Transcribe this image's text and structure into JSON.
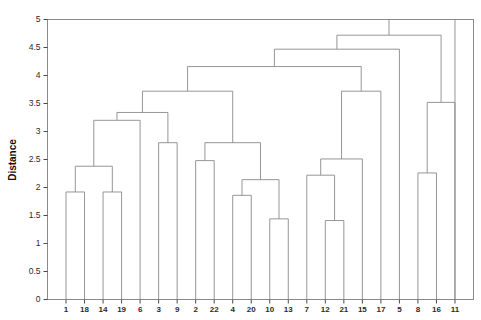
{
  "chart_data": {
    "type": "dendrogram",
    "title": "",
    "xlabel": "",
    "ylabel": "Distance",
    "ylim": [
      0,
      5
    ],
    "yticks": [
      0,
      0.5,
      1,
      1.5,
      2,
      2.5,
      3,
      3.5,
      4,
      4.5,
      5
    ],
    "ytick_labels": [
      "0",
      "0.5",
      "1",
      "1.5",
      "2",
      "2.5",
      "3",
      "3.5",
      "4",
      "4.5",
      "5"
    ],
    "grid": false,
    "legend": null,
    "leaf_order": [
      "1",
      "18",
      "14",
      "19",
      "6",
      "3",
      "9",
      "2",
      "22",
      "4",
      "20",
      "10",
      "13",
      "7",
      "12",
      "21",
      "15",
      "17",
      "5",
      "8",
      "16",
      "11"
    ],
    "leaf_count": 22,
    "line_color": "#8a8a8a",
    "frame_color": "#8a8a8a",
    "text_color": "#2b2b2b",
    "links": [
      {
        "id": "m1",
        "left": "1",
        "right": "18",
        "height": 1.92
      },
      {
        "id": "m2",
        "left": "14",
        "right": "19",
        "height": 1.92
      },
      {
        "id": "m3",
        "left": "m1",
        "right": "m2",
        "height": 2.38
      },
      {
        "id": "m4",
        "left": "m3",
        "right": "6",
        "height": 3.2
      },
      {
        "id": "m5",
        "left": "3",
        "right": "9",
        "height": 2.8
      },
      {
        "id": "m6",
        "left": "m4",
        "right": "m5",
        "height": 3.34
      },
      {
        "id": "m7",
        "left": "2",
        "right": "22",
        "height": 2.48
      },
      {
        "id": "m8",
        "left": "4",
        "right": "20",
        "height": 1.86
      },
      {
        "id": "m9",
        "left": "10",
        "right": "13",
        "height": 1.44
      },
      {
        "id": "m10",
        "left": "m8",
        "right": "m9",
        "height": 2.14
      },
      {
        "id": "m11",
        "left": "m7",
        "right": "m10",
        "height": 2.8
      },
      {
        "id": "m12",
        "left": "m6",
        "right": "m11",
        "height": 3.72
      },
      {
        "id": "m13",
        "left": "12",
        "right": "21",
        "height": 1.41
      },
      {
        "id": "m14",
        "left": "7",
        "right": "m13",
        "height": 2.22
      },
      {
        "id": "m15",
        "left": "m14",
        "right": "15",
        "height": 2.51
      },
      {
        "id": "m16",
        "left": "m15",
        "right": "17",
        "height": 3.72
      },
      {
        "id": "m17",
        "left": "m12",
        "right": "m16",
        "height": 4.16
      },
      {
        "id": "m18",
        "left": "m17",
        "right": "5",
        "height": 4.47
      },
      {
        "id": "m19",
        "left": "8",
        "right": "16",
        "height": 2.26
      },
      {
        "id": "m20",
        "left": "m19",
        "right": "11",
        "height": 3.52
      },
      {
        "id": "m21",
        "left": "m18",
        "right": "m20",
        "height": 4.72
      },
      {
        "id": "root",
        "left": "m21",
        "right": "11_edge",
        "height": 5.0
      }
    ]
  },
  "axis": {
    "y_title": "Distance"
  }
}
